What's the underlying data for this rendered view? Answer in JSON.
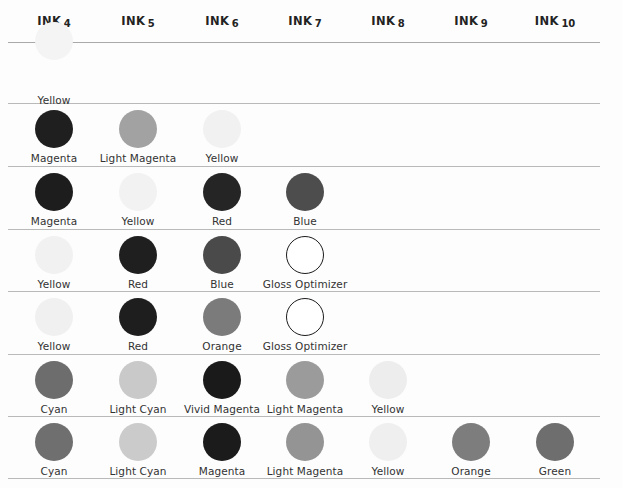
{
  "table": {
    "columns": [
      {
        "word": "INK",
        "number": "4"
      },
      {
        "word": "INK",
        "number": "5"
      },
      {
        "word": "INK",
        "number": "6"
      },
      {
        "word": "INK",
        "number": "7"
      },
      {
        "word": "INK",
        "number": "8"
      },
      {
        "word": "INK",
        "number": "9"
      },
      {
        "word": "INK",
        "number": "10"
      }
    ],
    "column_centers": [
      54,
      138,
      222,
      305,
      388,
      471,
      555
    ],
    "rule_positions": [
      42,
      103,
      166,
      229,
      291,
      354,
      416,
      478
    ],
    "row_tops": [
      52,
      110,
      173,
      236,
      298,
      361,
      423
    ],
    "rows": [
      {
        "clipped": true,
        "cells": [
          {
            "label": "Yellow",
            "color": "#f4f4f4",
            "style": "filled"
          },
          {
            "label": "",
            "color": "",
            "style": "empty"
          },
          {
            "label": "",
            "color": "",
            "style": "empty"
          },
          {
            "label": "",
            "color": "",
            "style": "empty"
          },
          {
            "label": "",
            "color": "",
            "style": "empty"
          },
          {
            "label": "",
            "color": "",
            "style": "empty"
          },
          {
            "label": "",
            "color": "",
            "style": "empty"
          }
        ]
      },
      {
        "clipped": false,
        "cells": [
          {
            "label": "Magenta",
            "color": "#1f1f1f",
            "style": "filled"
          },
          {
            "label": "Light Magenta",
            "color": "#a2a2a2",
            "style": "filled"
          },
          {
            "label": "Yellow",
            "color": "#f1f1f1",
            "style": "filled"
          },
          {
            "label": "",
            "color": "",
            "style": "empty"
          },
          {
            "label": "",
            "color": "",
            "style": "empty"
          },
          {
            "label": "",
            "color": "",
            "style": "empty"
          },
          {
            "label": "",
            "color": "",
            "style": "empty"
          }
        ]
      },
      {
        "clipped": false,
        "cells": [
          {
            "label": "Magenta",
            "color": "#1d1d1d",
            "style": "filled"
          },
          {
            "label": "Yellow",
            "color": "#f2f2f2",
            "style": "filled"
          },
          {
            "label": "Red",
            "color": "#252525",
            "style": "filled"
          },
          {
            "label": "Blue",
            "color": "#4d4d4d",
            "style": "filled"
          },
          {
            "label": "",
            "color": "",
            "style": "empty"
          },
          {
            "label": "",
            "color": "",
            "style": "empty"
          },
          {
            "label": "",
            "color": "",
            "style": "empty"
          }
        ]
      },
      {
        "clipped": false,
        "cells": [
          {
            "label": "Yellow",
            "color": "#f1f1f1",
            "style": "filled"
          },
          {
            "label": "Red",
            "color": "#1f1f1f",
            "style": "filled"
          },
          {
            "label": "Blue",
            "color": "#4a4a4a",
            "style": "filled"
          },
          {
            "label": "Gloss Optimizer",
            "color": "#ffffff",
            "style": "outline"
          },
          {
            "label": "",
            "color": "",
            "style": "empty"
          },
          {
            "label": "",
            "color": "",
            "style": "empty"
          },
          {
            "label": "",
            "color": "",
            "style": "empty"
          }
        ]
      },
      {
        "clipped": false,
        "cells": [
          {
            "label": "Yellow",
            "color": "#f0f0f0",
            "style": "filled"
          },
          {
            "label": "Red",
            "color": "#1e1e1e",
            "style": "filled"
          },
          {
            "label": "Orange",
            "color": "#7b7b7b",
            "style": "filled"
          },
          {
            "label": "Gloss Optimizer",
            "color": "#ffffff",
            "style": "outline"
          },
          {
            "label": "",
            "color": "",
            "style": "empty"
          },
          {
            "label": "",
            "color": "",
            "style": "empty"
          },
          {
            "label": "",
            "color": "",
            "style": "empty"
          }
        ]
      },
      {
        "clipped": false,
        "cells": [
          {
            "label": "Cyan",
            "color": "#6d6d6d",
            "style": "filled"
          },
          {
            "label": "Light Cyan",
            "color": "#c9c9c9",
            "style": "filled"
          },
          {
            "label": "Vivid Magenta",
            "color": "#1a1a1a",
            "style": "filled"
          },
          {
            "label": "Light Magenta",
            "color": "#9b9b9b",
            "style": "filled"
          },
          {
            "label": "Yellow",
            "color": "#ededed",
            "style": "filled"
          },
          {
            "label": "",
            "color": "",
            "style": "empty"
          },
          {
            "label": "",
            "color": "",
            "style": "empty"
          }
        ]
      },
      {
        "clipped": false,
        "cells": [
          {
            "label": "Cyan",
            "color": "#6f6f6f",
            "style": "filled"
          },
          {
            "label": "Light Cyan",
            "color": "#cbcbcb",
            "style": "filled"
          },
          {
            "label": "Magenta",
            "color": "#1b1b1b",
            "style": "filled"
          },
          {
            "label": "Light Magenta",
            "color": "#949494",
            "style": "filled"
          },
          {
            "label": "Yellow",
            "color": "#efefef",
            "style": "filled"
          },
          {
            "label": "Orange",
            "color": "#7d7d7d",
            "style": "filled"
          },
          {
            "label": "Green",
            "color": "#6e6e6e",
            "style": "filled"
          }
        ]
      }
    ]
  }
}
